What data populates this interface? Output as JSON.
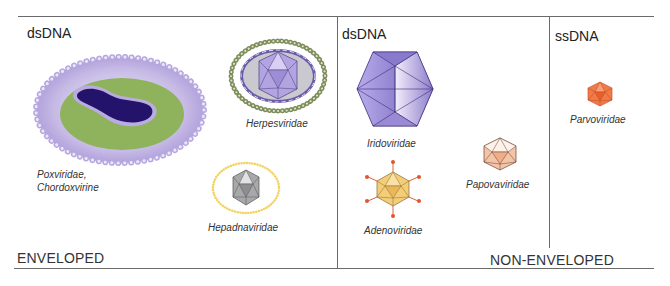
{
  "diagram": {
    "sections": {
      "enveloped": {
        "label": "ENVELOPED",
        "genome": "dsDNA",
        "families": [
          {
            "name": "Poxviridae,",
            "name2": "Chordoxvirine",
            "shape": "brick-shaped complex",
            "colors": {
              "envelope": "#b8a9dc",
              "core": "#8db25a",
              "nucleoid": "#2a1a6e"
            }
          },
          {
            "name": "Herpesviridae",
            "shape": "enveloped icosahedron",
            "colors": {
              "envelope_beads": "#7a8a5a",
              "capsid": "#a898d8",
              "tegument": "#c8c8cc"
            }
          },
          {
            "name": "Hepadnaviridae",
            "shape": "enveloped icosahedron",
            "colors": {
              "envelope_beads": "#f0d060",
              "capsid": "#a8a8a8"
            }
          }
        ]
      },
      "non_enveloped": {
        "label": "NON-ENVELOPED",
        "groups": [
          {
            "genome": "dsDNA",
            "families": [
              {
                "name": "Iridoviridae",
                "shape": "icosahedron (large)",
                "colors": {
                  "capsid": "#8a78c8"
                }
              },
              {
                "name": "Adenoviridae",
                "shape": "icosahedron with fibers",
                "colors": {
                  "capsid": "#f2c870",
                  "fibers": "#e05a30"
                }
              },
              {
                "name": "Papovaviridae",
                "shape": "icosahedron",
                "colors": {
                  "capsid": "#f0b898"
                }
              }
            ]
          },
          {
            "genome": "ssDNA",
            "families": [
              {
                "name": "Parvoviridae",
                "shape": "icosahedron (small)",
                "colors": {
                  "capsid": "#f07040"
                }
              }
            ]
          }
        ]
      }
    }
  }
}
